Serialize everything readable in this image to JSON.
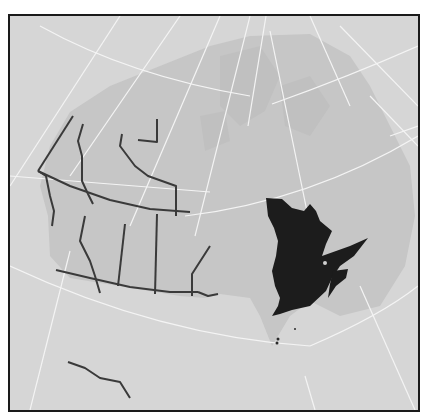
{
  "map": {
    "title": "",
    "subject": "Canada",
    "highlighted_region": "Quebec",
    "regions": [
      {
        "name": "Yukon",
        "role": "province-territory"
      },
      {
        "name": "Northwest Territories",
        "role": "province-territory"
      },
      {
        "name": "Nunavut",
        "role": "province-territory"
      },
      {
        "name": "British Columbia",
        "role": "province-territory"
      },
      {
        "name": "Alberta",
        "role": "province-territory"
      },
      {
        "name": "Saskatchewan",
        "role": "province-territory"
      },
      {
        "name": "Manitoba",
        "role": "province-territory"
      },
      {
        "name": "Ontario",
        "role": "province-territory"
      },
      {
        "name": "Quebec",
        "role": "highlighted"
      },
      {
        "name": "Newfoundland and Labrador",
        "role": "province-territory"
      },
      {
        "name": "Maritime Provinces",
        "role": "province-territory"
      },
      {
        "name": "United States",
        "role": "neighbor"
      }
    ],
    "graticule": true,
    "colors": {
      "background": "#d6d6d6",
      "land": "#c4c4c4",
      "highlight": "#1c1c1c",
      "border": "#3a3a3a",
      "graticule": "#f4f4f4",
      "frame": "#1a1a1a"
    }
  }
}
